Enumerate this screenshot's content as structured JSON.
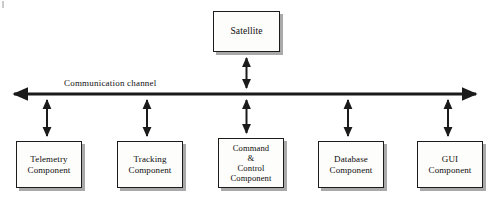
{
  "diagram": {
    "type": "block-diagram",
    "background_color": "#ffffff",
    "line_color": "#1b1b1b",
    "box_fill_color": "#fdfdfb",
    "shadow_color": "#a9a9a9",
    "channel": {
      "label": "Communication channel",
      "style": "double-headed-horizontal-arrow",
      "y": 94,
      "x_start": 5,
      "x_end": 485
    },
    "top_node": {
      "id": "satellite",
      "label": "Satellite",
      "lines": [
        "Satellite"
      ]
    },
    "components": [
      {
        "id": "telemetry",
        "lines": [
          "Telemetry",
          "Component"
        ]
      },
      {
        "id": "tracking",
        "lines": [
          "Tracking",
          "Component"
        ]
      },
      {
        "id": "command",
        "lines": [
          "Command",
          "&",
          "Control",
          "Component"
        ]
      },
      {
        "id": "database",
        "lines": [
          "Database",
          "Component"
        ]
      },
      {
        "id": "gui",
        "lines": [
          "GUI",
          "Component"
        ]
      }
    ],
    "connectors": [
      {
        "from": "satellite",
        "to": "channel",
        "style": "double-headed-vertical-arrow"
      },
      {
        "from": "channel",
        "to": "telemetry",
        "style": "double-headed-vertical-arrow"
      },
      {
        "from": "channel",
        "to": "tracking",
        "style": "double-headed-vertical-arrow"
      },
      {
        "from": "channel",
        "to": "command",
        "style": "double-headed-vertical-arrow"
      },
      {
        "from": "channel",
        "to": "database",
        "style": "double-headed-vertical-arrow"
      },
      {
        "from": "channel",
        "to": "gui",
        "style": "double-headed-vertical-arrow"
      }
    ]
  }
}
